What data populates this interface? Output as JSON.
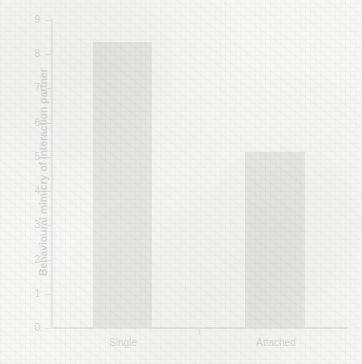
{
  "chart_data": {
    "type": "bar",
    "title": "",
    "subtitle": "",
    "xlabel": "",
    "ylabel": "Behavioural mimicry of interaction partner",
    "categories": [
      "Single",
      "Attached"
    ],
    "values": [
      8.35,
      5.15
    ],
    "series": [
      {
        "name": "Behavioural mimicry of interaction partner",
        "values": [
          8.35,
          5.15
        ]
      }
    ],
    "ylim": [
      0,
      9
    ],
    "ytick_labels": [
      "0",
      "1",
      "2",
      "3",
      "4",
      "5",
      "6",
      "7",
      "8",
      "9"
    ],
    "ytick_values": [
      0,
      1,
      2,
      3,
      4,
      5,
      6,
      7,
      8,
      9
    ],
    "grid": false,
    "legend": false,
    "legend_position": "none",
    "bar_color": "#8e8e8e",
    "axis_color": "#8a8a8a",
    "text_color": "#2b2b2b",
    "background_color": "#f6f6f5"
  }
}
